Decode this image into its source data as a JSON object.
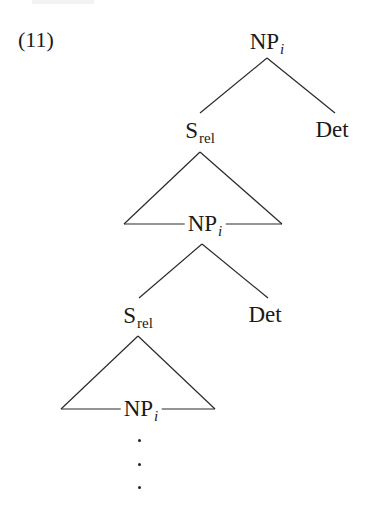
{
  "example": {
    "number": "(11)"
  },
  "tree": {
    "nodes": [
      {
        "id": "np1",
        "label": "NP",
        "sub": "i",
        "sub_style": "italic"
      },
      {
        "id": "srel1",
        "label": "S",
        "sub": "rel",
        "sub_style": "roman"
      },
      {
        "id": "det1",
        "label": "Det"
      },
      {
        "id": "np2",
        "label": "NP",
        "sub": "i",
        "sub_style": "italic"
      },
      {
        "id": "srel2",
        "label": "S",
        "sub": "rel",
        "sub_style": "roman"
      },
      {
        "id": "det2",
        "label": "Det"
      },
      {
        "id": "np3",
        "label": "NP",
        "sub": "i",
        "sub_style": "italic"
      }
    ],
    "edges": [
      [
        "np1",
        "srel1"
      ],
      [
        "np1",
        "det1"
      ],
      [
        "srel1",
        "np2 (triangle)"
      ],
      [
        "np2",
        "srel2"
      ],
      [
        "np2",
        "det2"
      ],
      [
        "srel2",
        "np3 (triangle)"
      ]
    ],
    "continuation": "⋮"
  }
}
